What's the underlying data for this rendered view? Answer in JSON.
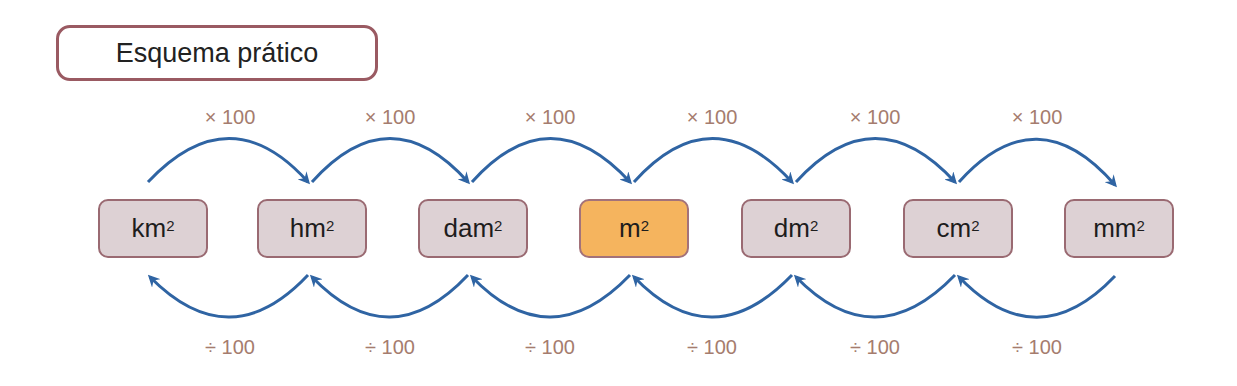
{
  "title": "Esquema prático",
  "units": [
    {
      "base": "km",
      "exp": "2",
      "highlighted": false
    },
    {
      "base": "hm",
      "exp": "2",
      "highlighted": false
    },
    {
      "base": "dam",
      "exp": "2",
      "highlighted": false
    },
    {
      "base": "m",
      "exp": "2",
      "highlighted": true
    },
    {
      "base": "dm",
      "exp": "2",
      "highlighted": false
    },
    {
      "base": "cm",
      "exp": "2",
      "highlighted": false
    },
    {
      "base": "mm",
      "exp": "2",
      "highlighted": false
    }
  ],
  "multiply_labels": [
    "× 100",
    "× 100",
    "× 100",
    "× 100",
    "× 100",
    "× 100"
  ],
  "divide_labels": [
    "÷ 100",
    "÷ 100",
    "÷ 100",
    "÷ 100",
    "÷ 100",
    "÷ 100"
  ],
  "colors": {
    "arrow": "#2f64a3",
    "unit_fill": "#ddd1d4",
    "unit_highlight": "#f5b45e",
    "unit_border": "#9a6a72",
    "operator_text": "#a57c6e",
    "title_border": "#9a5a62"
  }
}
